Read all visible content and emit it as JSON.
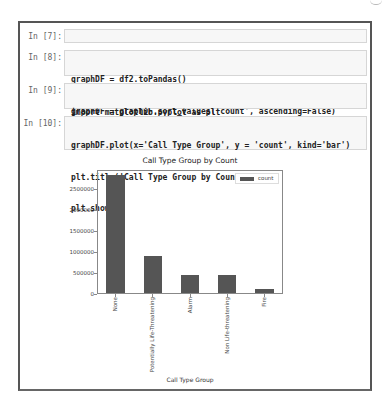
{
  "notebook": {
    "cells": [
      {
        "prompt": "In [7]:",
        "lines": [
          "df2 = df.groupBy('Call Type Group').count()"
        ]
      },
      {
        "prompt": "In [8]:",
        "lines": [
          "graphDF = df2.toPandas()",
          "graphDF = graphDF.sort_values('count', ascending=False)"
        ]
      },
      {
        "prompt": "In [9]:",
        "lines": [
          "import matplotlib.pyplot as plt",
          "%matplotlib inline"
        ]
      },
      {
        "prompt": "In [10]:",
        "lines": [
          "graphDF.plot(x='Call Type Group', y = 'count', kind='bar')",
          "plt.title('Call Type Group by Count')",
          "plt.show()"
        ]
      }
    ]
  },
  "chart_data": {
    "type": "bar",
    "title": "Call Type Group by Count",
    "xlabel": "Call Type Group",
    "ylabel": "",
    "categories": [
      "None",
      "Potentially Life-Threatening",
      "Alarm",
      "Non Life-threatening",
      "Fire"
    ],
    "series": [
      {
        "name": "count",
        "values": [
          2810000,
          880000,
          435000,
          420000,
          90000
        ],
        "color": "#555555"
      }
    ],
    "yticks": [
      "0",
      "500000",
      "1000000",
      "1500000",
      "2000000",
      "2500000"
    ],
    "ylim": [
      0,
      2950000
    ],
    "grid": false,
    "legend": {
      "position": "upper right",
      "entries": [
        "count"
      ]
    }
  }
}
